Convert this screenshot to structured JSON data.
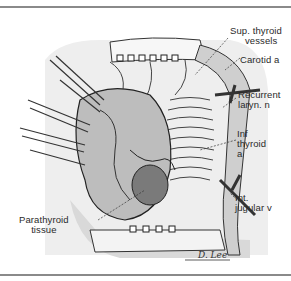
{
  "figure": {
    "background_color": "#ffffff",
    "rule_color": "#8a8a8a",
    "ink_color": "#2a2a2a",
    "shade_color": "#e4e4e4"
  },
  "labels": {
    "sup_thyroid_vessels": {
      "line1": "Sup. thyroid",
      "line2": "vessels"
    },
    "carotid": {
      "line1": "Carotid a"
    },
    "recurrent_laryn": {
      "line1": "Recurrent",
      "line2": "laryn. n"
    },
    "inf_thyroid": {
      "line1": "Inf",
      "line2": "thyroid",
      "line3": "a"
    },
    "int_jugular": {
      "line1": "Int.",
      "line2": "jugular v"
    },
    "parathyroid": {
      "line1": "Parathyroid",
      "line2": "tissue"
    }
  },
  "signature": "D. Lee"
}
